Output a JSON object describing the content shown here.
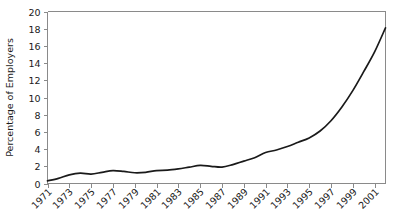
{
  "chart_data": {
    "type": "line",
    "title": "",
    "xlabel": "",
    "ylabel": "Percentage of Employers",
    "xlim": [
      1971,
      2002
    ],
    "ylim": [
      0,
      20
    ],
    "grid": false,
    "legend": "none",
    "series": [
      {
        "name": "Percentage of Employers",
        "color": "#1a1a1a",
        "x": [
          1971,
          1972,
          1973,
          1974,
          1975,
          1976,
          1977,
          1978,
          1979,
          1980,
          1981,
          1982,
          1983,
          1984,
          1985,
          1986,
          1987,
          1988,
          1989,
          1990,
          1991,
          1992,
          1993,
          1994,
          1995,
          1996,
          1997,
          1998,
          1999,
          2000,
          2001,
          2002
        ],
        "values": [
          0.3,
          0.6,
          1.0,
          1.2,
          1.1,
          1.3,
          1.5,
          1.4,
          1.25,
          1.3,
          1.5,
          1.55,
          1.7,
          1.9,
          2.1,
          2.0,
          1.9,
          2.2,
          2.6,
          3.0,
          3.6,
          3.9,
          4.3,
          4.8,
          5.3,
          6.1,
          7.3,
          8.9,
          10.8,
          13.0,
          15.3,
          18.1
        ]
      }
    ],
    "y_ticks": [
      0,
      2,
      4,
      6,
      8,
      10,
      12,
      14,
      16,
      18,
      20
    ],
    "y_tick_labels": [
      "0",
      "2",
      "4",
      "6",
      "8",
      "10",
      "12",
      "14",
      "16",
      "18",
      "20"
    ],
    "x_ticks": [
      1971,
      1973,
      1975,
      1977,
      1979,
      1981,
      1983,
      1985,
      1987,
      1989,
      1991,
      1993,
      1995,
      1997,
      1999,
      2001
    ],
    "x_tick_labels": [
      "1971",
      "1973",
      "1975",
      "1977",
      "1979",
      "1981",
      "1983",
      "1985",
      "1987",
      "1989",
      "1991",
      "1993",
      "1995",
      "1997",
      "1999",
      "2001"
    ],
    "x_tick_rotation": -45,
    "axis_color": "#8a8a8a",
    "background_color": "#ffffff"
  }
}
